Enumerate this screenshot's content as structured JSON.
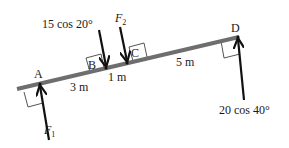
{
  "diagram": {
    "points": [
      {
        "id": "A",
        "label": "A"
      },
      {
        "id": "B",
        "label": "B"
      },
      {
        "id": "C",
        "label": "C"
      },
      {
        "id": "D",
        "label": "D"
      }
    ],
    "forces": [
      {
        "id": "F1",
        "label": "F",
        "subscript": "1",
        "at": "A",
        "direction": "up"
      },
      {
        "id": "B_force",
        "label": "15 cos 20°",
        "at": "B",
        "direction": "down"
      },
      {
        "id": "F2",
        "label": "F",
        "subscript": "2",
        "at": "C",
        "direction": "down"
      },
      {
        "id": "D_force",
        "label": "20 cos 40°",
        "at": "D",
        "direction": "up"
      }
    ],
    "distances": [
      {
        "from": "A",
        "to": "B",
        "label": "3 m"
      },
      {
        "from": "B",
        "to": "C",
        "label": "1 m"
      },
      {
        "from": "C",
        "to": "D",
        "label": "5 m"
      }
    ],
    "colors": {
      "beam": "#6e6e6e",
      "arrow": "#111111",
      "box": "#555555",
      "text": "#1a1a1a"
    }
  }
}
